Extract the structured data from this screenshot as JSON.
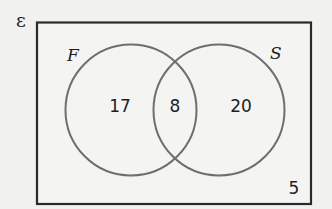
{
  "diagram": {
    "type": "venn",
    "universe_symbol": "ε",
    "sets": [
      {
        "name": "F",
        "only_count": "17"
      },
      {
        "name": "S",
        "only_count": "20"
      }
    ],
    "intersection_count": "8",
    "outside_count": "5"
  },
  "colors": {
    "background": "#f1f1f0",
    "rectangle_stroke": "#2a2a2a",
    "circle_stroke": "#6e6e6e",
    "text": "#1e1e1e"
  }
}
